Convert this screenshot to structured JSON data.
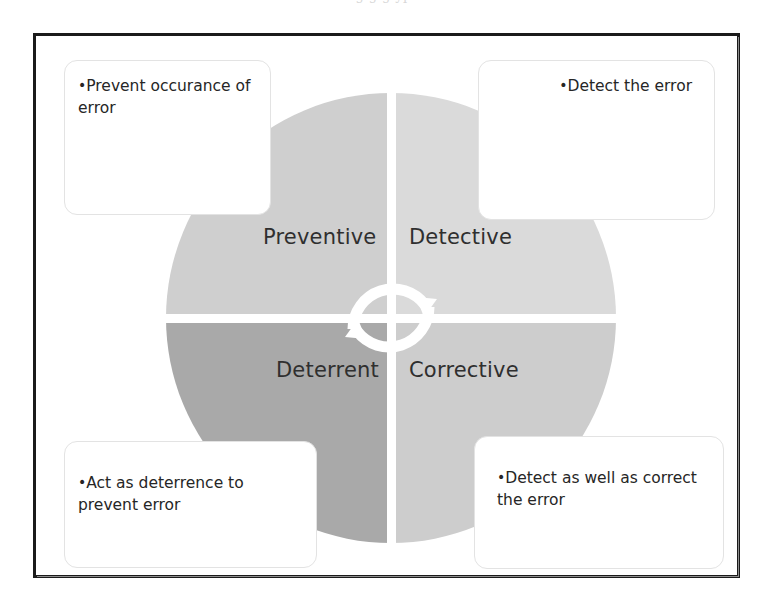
{
  "scan": {
    "top_remnant": "g   g   g  yp"
  },
  "diagram": {
    "center_icon": "cycle-arrows-icon",
    "quadrants": [
      {
        "id": "preventive",
        "label": "Preventive",
        "color": "#cfcfcf",
        "position": "top-left",
        "callout": {
          "bullet": "•",
          "lines": [
            "Prevent",
            "occurance of",
            "error"
          ],
          "text": "Prevent occurance of error",
          "align": "left"
        }
      },
      {
        "id": "detective",
        "label": "Detective",
        "color": "#dadada",
        "position": "top-right",
        "callout": {
          "bullet": "•",
          "lines": [
            "Detect the",
            "error"
          ],
          "text": "Detect the error",
          "align": "right"
        }
      },
      {
        "id": "deterrent",
        "label": "Deterrent",
        "color": "#a9a9a9",
        "position": "bottom-left",
        "callout": {
          "bullet": "•",
          "lines": [
            "Act as",
            "deterrence to",
            "prevent error"
          ],
          "text": "Act as deterrence to prevent error",
          "align": "left"
        }
      },
      {
        "id": "corrective",
        "label": "Corrective",
        "color": "#cdcdcd",
        "position": "bottom-right",
        "callout": {
          "bullet": "•",
          "lines": [
            "Detect as well",
            "as correct the",
            "error"
          ],
          "text": "Detect as well as correct the error",
          "align": "left"
        }
      }
    ],
    "colors": {
      "frame_border": "#1b1b1b",
      "callout_border": "#e3e3e3",
      "label_text": "#2f2f2f",
      "body_text": "#262626",
      "separator": "#ffffff",
      "background": "#ffffff"
    }
  }
}
